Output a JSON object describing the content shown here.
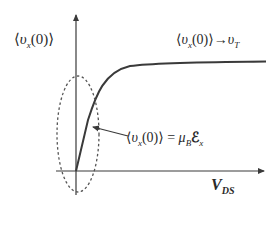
{
  "diagram": {
    "title": "",
    "y_axis": {
      "label_open": "⟨",
      "label_var": "υ",
      "label_sub": "x",
      "label_arg": "(0)",
      "label_close": "⟩"
    },
    "x_axis": {
      "label_main": "V",
      "label_sub": "DS"
    },
    "saturation_label": {
      "open": "⟨",
      "var": "υ",
      "sub": "x",
      "arg": "(0)",
      "close": "⟩",
      "arrow": "→",
      "target_var": "υ",
      "target_sub": "T"
    },
    "linear_label": {
      "open": "⟨",
      "var": "υ",
      "sub": "x",
      "arg": "(0)",
      "close": "⟩",
      "equals": "=",
      "mu": "μ",
      "mu_sub": "B",
      "field": "ℰ",
      "field_sub": "x"
    },
    "colors": {
      "curve": "#3a3a3a",
      "axes": "#3a3a3a",
      "ellipse": "#555555",
      "background": "#ffffff"
    }
  }
}
